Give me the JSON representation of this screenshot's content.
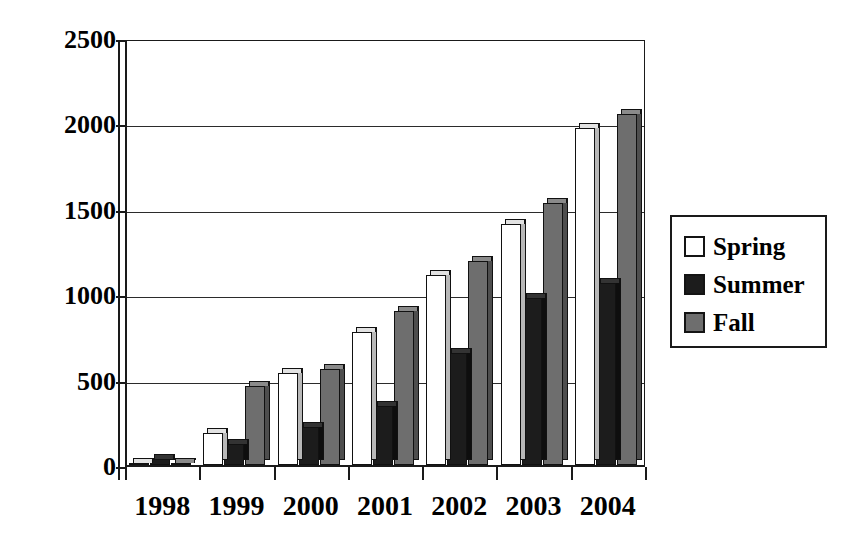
{
  "chart_data": {
    "type": "bar",
    "title": "",
    "subtitle": "",
    "xlabel": "",
    "ylabel": "",
    "categories": [
      "1998",
      "1999",
      "2000",
      "2001",
      "2002",
      "2003",
      "2004"
    ],
    "series": [
      {
        "name": "Spring",
        "values": [
          0,
          190,
          540,
          780,
          1110,
          1410,
          1975
        ]
      },
      {
        "name": "Summer",
        "values": [
          35,
          125,
          220,
          345,
          655,
          980,
          1065
        ]
      },
      {
        "name": "Fall",
        "values": [
          0,
          460,
          565,
          900,
          1195,
          1535,
          2055
        ]
      }
    ],
    "ylim": [
      0,
      2500
    ],
    "yticks": [
      0,
      500,
      1000,
      1500,
      2000,
      2500
    ],
    "ytick_labels": [
      "0",
      "500",
      "1000",
      "1500",
      "2000",
      "2500"
    ],
    "grid": true,
    "grid_axis": "y",
    "legend_position": "right",
    "legend_entries": [
      {
        "label": "Spring",
        "swatch": "white-open-square",
        "color": "#ffffff"
      },
      {
        "label": "Summer",
        "swatch": "black-filled-square",
        "color": "#1c1c1c"
      },
      {
        "label": "Fall",
        "swatch": "gray-filled-square",
        "color": "#6e6e6e"
      }
    ],
    "bar_style": "3d-clustered-column",
    "colors": {
      "spring": "#ffffff",
      "summer": "#1c1c1c",
      "fall": "#6e6e6e",
      "axis": "#1a1a1a",
      "grid": "#2b2b2b",
      "background": "#ffffff"
    }
  }
}
